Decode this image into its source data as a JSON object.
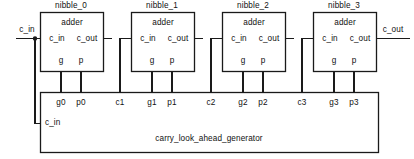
{
  "diagram": {
    "title_text": "carry_look_ahead_generator",
    "external_inputs": [
      {
        "name": "c_in",
        "label": "c_in"
      }
    ],
    "external_outputs": [
      {
        "name": "c_out",
        "label": "c_out"
      }
    ],
    "blocks": [
      {
        "id": "nibble_0",
        "title": "nibble_0",
        "body_label": "adder",
        "ports_top": [],
        "port_c_in": "c_in",
        "port_c_out": "c_out",
        "port_g": "g",
        "port_p": "p"
      },
      {
        "id": "nibble_1",
        "title": "nibble_1",
        "body_label": "adder",
        "ports_top": [],
        "port_c_in": "c_in",
        "port_c_out": "c_out",
        "port_g": "g",
        "port_p": "p"
      },
      {
        "id": "nibble_2",
        "title": "nibble_2",
        "body_label": "adder",
        "ports_top": [],
        "port_c_in": "c_in",
        "port_c_out": "c_out",
        "port_g": "g",
        "port_p": "p"
      },
      {
        "id": "nibble_3",
        "title": "nibble_3",
        "body_label": "adder",
        "ports_top": [],
        "port_c_in": "c_in",
        "port_c_out": "c_out",
        "port_g": "g",
        "port_p": "p"
      }
    ],
    "clag": {
      "name": "carry_look_ahead_generator",
      "label": "carry_look_ahead_generator",
      "c_in_label": "c_in",
      "top_ports": [
        {
          "name": "g0",
          "label": "g0"
        },
        {
          "name": "p0",
          "label": "p0"
        },
        {
          "name": "c1",
          "label": "c1"
        },
        {
          "name": "g1",
          "label": "g1"
        },
        {
          "name": "p1",
          "label": "p1"
        },
        {
          "name": "c2",
          "label": "c2"
        },
        {
          "name": "g2",
          "label": "g2"
        },
        {
          "name": "p2",
          "label": "p2"
        },
        {
          "name": "c3",
          "label": "c3"
        },
        {
          "name": "g3",
          "label": "g3"
        },
        {
          "name": "p3",
          "label": "p3"
        }
      ]
    },
    "colors": {
      "line": "#1a1a1a",
      "text": "#111111",
      "background": "#ffffff"
    }
  }
}
